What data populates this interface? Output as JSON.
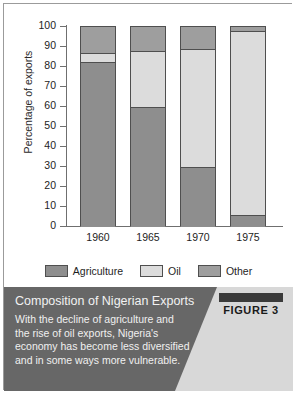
{
  "chart_data": {
    "type": "bar",
    "subtype": "stacked-100-percent",
    "title": "Composition of Nigerian Exports",
    "xlabel": "",
    "ylabel": "Percentage of exports",
    "ylim": [
      0,
      100
    ],
    "ytick_step": 10,
    "yticks": [
      0,
      10,
      20,
      30,
      40,
      50,
      60,
      70,
      80,
      90,
      100
    ],
    "grid": false,
    "legend_position": "bottom",
    "categories": [
      "1960",
      "1965",
      "1970",
      "1975"
    ],
    "series": [
      {
        "name": "Agriculture",
        "color": "#8e8e8e",
        "values": [
          82.5,
          60,
          30,
          6
        ]
      },
      {
        "name": "Oil",
        "color": "#dcdcdc",
        "values": [
          4.5,
          28,
          59,
          92
        ]
      },
      {
        "name": "Other",
        "color": "#9e9e9e",
        "values": [
          13,
          12,
          11,
          2
        ]
      }
    ]
  },
  "axis": {
    "ylabel": "Percentage of exports",
    "yticks": [
      "100",
      "90",
      "80",
      "70",
      "60",
      "50",
      "40",
      "30",
      "20",
      "10",
      "0"
    ],
    "xticks": [
      "1960",
      "1965",
      "1970",
      "1975"
    ]
  },
  "legend": {
    "items": [
      {
        "label": "Agriculture",
        "color": "#8e8e8e"
      },
      {
        "label": "Oil",
        "color": "#dcdcdc"
      },
      {
        "label": "Other",
        "color": "#9e9e9e"
      }
    ]
  },
  "caption": {
    "title": "Composition of Nigerian Exports",
    "body": "With the decline of agriculture and the rise of oil exports, Nigeria's economy has become less diversified and in some ways more vulnerable.",
    "figure_label": "FIGURE 3"
  }
}
